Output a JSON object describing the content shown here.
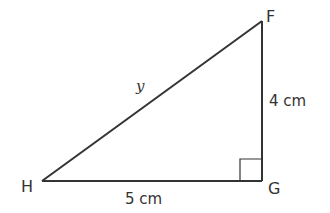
{
  "diagram": {
    "type": "right-triangle",
    "colors": {
      "stroke": "#333333",
      "text": "#333333",
      "background": "#ffffff"
    },
    "vertices": [
      {
        "id": "F",
        "label": "F",
        "x": 262,
        "y": 21
      },
      {
        "id": "G",
        "label": "G",
        "x": 262,
        "y": 181
      },
      {
        "id": "H",
        "label": "H",
        "x": 42,
        "y": 181
      }
    ],
    "sides": {
      "HG": {
        "label": "5 cm"
      },
      "GF": {
        "label": "4 cm"
      },
      "HF": {
        "label": "y"
      }
    },
    "right_angle_at": "G"
  }
}
